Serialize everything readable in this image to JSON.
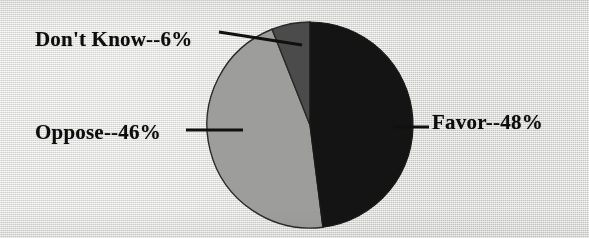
{
  "chart_data": {
    "type": "pie",
    "title": "",
    "subtitle": "",
    "xlabel": "",
    "ylabel": "",
    "legend_position": "none",
    "grid": false,
    "labels_format": "{name}--{value}%",
    "categories": [
      "Favor",
      "Oppose",
      "Don't Know"
    ],
    "values": [
      48,
      46,
      6
    ],
    "units": "percent",
    "total": 100,
    "start_angle_deg": 0,
    "direction": "clockwise",
    "slices": [
      {
        "name": "Favor",
        "value": 48,
        "label": "Favor--48%",
        "color": "#141414",
        "start_angle_deg": 0,
        "end_angle_deg": 172.8,
        "leader_line": true
      },
      {
        "name": "Oppose",
        "value": 46,
        "label": "Oppose--46%",
        "color": "#9d9d9b",
        "start_angle_deg": 172.8,
        "end_angle_deg": 338.4,
        "leader_line": true
      },
      {
        "name": "Don't Know",
        "value": 6,
        "label": "Don't Know--6%",
        "color": "#4b4b4b",
        "start_angle_deg": 338.4,
        "end_angle_deg": 360,
        "leader_line": true
      }
    ]
  },
  "labels": {
    "dont_know": "Don't Know--6%",
    "oppose": "Oppose--46%",
    "favor": "Favor--48%"
  },
  "colors": {
    "background": "#dededc",
    "favor_slice": "#141414",
    "oppose_slice": "#9d9d9b",
    "dont_know_slice": "#4b4b4b",
    "outline": "#2a2a2a",
    "label_text": "#0d0d0d",
    "leader_line": "#101010"
  }
}
